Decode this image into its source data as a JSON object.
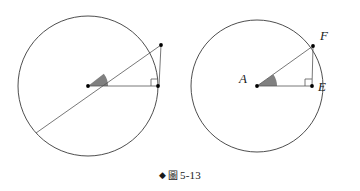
{
  "figure": {
    "caption_marker": "◆",
    "caption_cjk": "圖",
    "caption_number": "5-13",
    "caption_full": "◆ 圖 5-13",
    "background_color": "#ffffff",
    "stroke_color": "#3a3a3a",
    "line_color": "#555555",
    "wedge_fill_color": "#808080",
    "point_color": "#000000"
  },
  "left_diagram": {
    "name": "circle-unlabeled",
    "circle": {
      "cx": 88,
      "cy": 86,
      "r": 70
    },
    "center_point": {
      "x": 88,
      "y": 86
    },
    "diameter_endpoint_far": {
      "x": 36,
      "y": 133
    },
    "upper_right_point": {
      "x": 161,
      "y": 45
    },
    "right_edge_point": {
      "x": 158,
      "y": 86
    },
    "right_angle_mark": {
      "x": 158,
      "y": 86,
      "size": 7
    },
    "angle_wedge": {
      "radius": 20,
      "start_deg": 0,
      "end_deg": 38
    }
  },
  "right_diagram": {
    "name": "circle-labeled-AEF",
    "circle": {
      "cx": 257,
      "cy": 86,
      "r": 66
    },
    "points": [
      {
        "id": "A",
        "label": "A",
        "x": 257,
        "y": 86,
        "role": "center"
      },
      {
        "id": "F",
        "label": "F",
        "x": 313,
        "y": 46,
        "role": "upper-right"
      },
      {
        "id": "E",
        "label": "E",
        "x": 312,
        "y": 86,
        "role": "right-edge"
      }
    ],
    "right_angle_mark": {
      "x": 312,
      "y": 86,
      "size": 7
    },
    "angle_wedge": {
      "radius": 20,
      "start_deg": 0,
      "end_deg": 35
    }
  }
}
